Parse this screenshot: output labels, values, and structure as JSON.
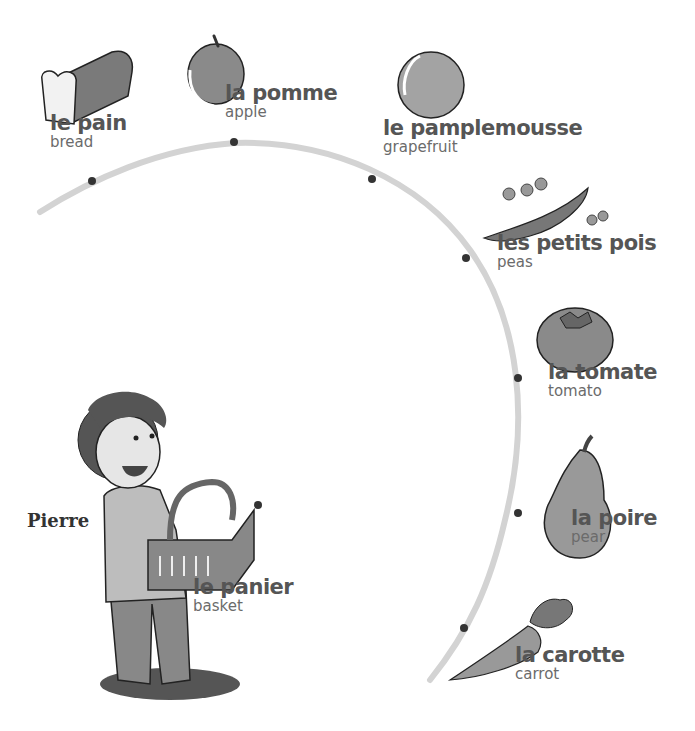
{
  "character": {
    "name": "Pierre"
  },
  "path": {
    "color": "#d0d0d0",
    "dot_color": "#333333"
  },
  "items": [
    {
      "french": "le pain",
      "english": "bread",
      "icon": "bread-icon"
    },
    {
      "french": "la pomme",
      "english": "apple",
      "icon": "apple-icon"
    },
    {
      "french": "le pamplemousse",
      "english": "grapefruit",
      "icon": "grapefruit-icon"
    },
    {
      "french": "les petits pois",
      "english": "peas",
      "icon": "peas-icon"
    },
    {
      "french": "la tomate",
      "english": "tomato",
      "icon": "tomato-icon"
    },
    {
      "french": "la poire",
      "english": "pear",
      "icon": "pear-icon"
    },
    {
      "french": "la carotte",
      "english": "carrot",
      "icon": "carrot-icon"
    },
    {
      "french": "le panier",
      "english": "basket",
      "icon": "basket-icon"
    }
  ]
}
